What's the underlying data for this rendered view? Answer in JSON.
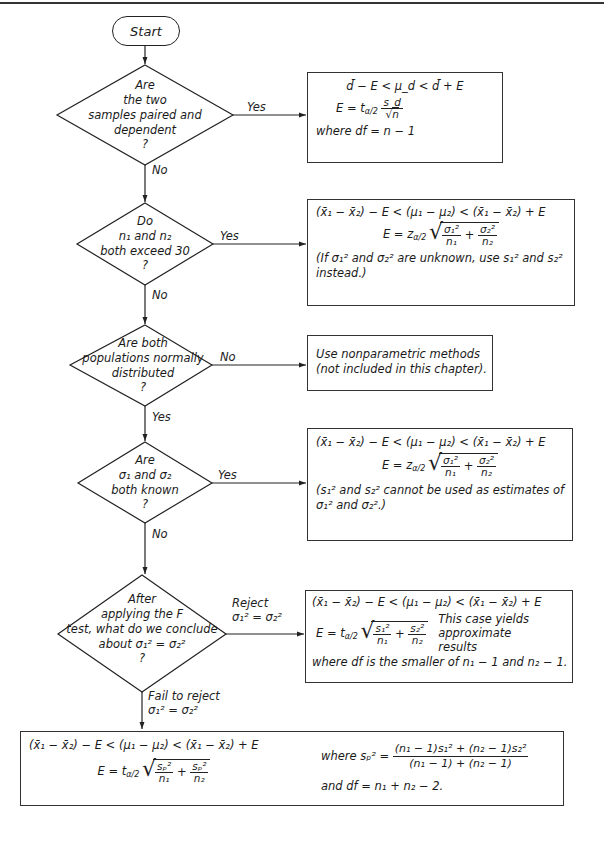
{
  "page": {
    "number": ""
  },
  "flowchart": {
    "start": {
      "label": "Start"
    },
    "decisions": [
      {
        "id": "paired",
        "lines": [
          "Are",
          "the two",
          "samples paired and",
          "dependent",
          "?"
        ],
        "yes_label": "Yes",
        "no_label": "No"
      },
      {
        "id": "large_n",
        "lines": [
          "Do",
          "n₁ and n₂",
          "both exceed 30",
          "?"
        ],
        "yes_label": "Yes",
        "no_label": "No"
      },
      {
        "id": "normal",
        "lines": [
          "Are both",
          "populations normally",
          "distributed",
          "?"
        ],
        "no_label": "No",
        "yes_label": "Yes"
      },
      {
        "id": "sigma_known",
        "lines": [
          "Are",
          "σ₁ and σ₂",
          "both known",
          "?"
        ],
        "yes_label": "Yes",
        "no_label": "No"
      },
      {
        "id": "f_test",
        "lines": [
          "After",
          "applying the F",
          "test, what do we conclude",
          "about  σ₁² = σ₂²",
          "?"
        ],
        "reject_label": [
          "Reject",
          "σ₁² = σ₂²"
        ],
        "fail_label": [
          "Fail to reject",
          "σ₁² = σ₂²"
        ]
      }
    ],
    "results": {
      "paired": {
        "interval": "d̄ − E < μ_d < d̄ + E",
        "margin_lhs": "E = t",
        "margin_sub": "α/2",
        "margin_num": "s_d",
        "margin_den": "n",
        "df": "where df = n − 1"
      },
      "large_samples": {
        "interval": "(x̄₁ − x̄₂) − E < (μ₁ − μ₂) < (x̄₁ − x̄₂) + E",
        "margin_lhs": "E = z",
        "margin_sub": "α/2",
        "term1_num": "σ₁²",
        "term1_den": "n₁",
        "term2_num": "σ₂²",
        "term2_den": "n₂",
        "note_line1": "(If σ₁² and σ₂² are unknown, use s₁² and s₂²",
        "note_line2": "instead.)"
      },
      "nonparametric": {
        "line1": "Use nonparametric methods",
        "line2": "(not included in this chapter)."
      },
      "sigma_known": {
        "interval": "(x̄₁ − x̄₂) − E < (μ₁ − μ₂) < (x̄₁ − x̄₂) + E",
        "margin_lhs": "E = z",
        "margin_sub": "α/2",
        "term1_num": "σ₁²",
        "term1_den": "n₁",
        "term2_num": "σ₂²",
        "term2_den": "n₂",
        "note_line1": "(s₁² and s₂² cannot be used as estimates of",
        "note_line2": "σ₁² and σ₂².)"
      },
      "unequal_var": {
        "interval": "(x̄₁ − x̄₂) − E < (μ₁ − μ₂) < (x̄₁ − x̄₂) + E",
        "margin_lhs": "E = t",
        "margin_sub": "α/2",
        "term1_num": "s₁²",
        "term1_den": "n₁",
        "term2_num": "s₂²",
        "term2_den": "n₂",
        "side_note": [
          "This case yields",
          "approximate",
          "results"
        ],
        "df": "where df is the smaller of n₁ − 1 and n₂ − 1."
      },
      "pooled": {
        "interval": "(x̄₁ − x̄₂) − E < (μ₁ − μ₂) < (x̄₁ − x̄₂) + E",
        "margin_lhs": "E = t",
        "margin_sub": "α/2",
        "term1_num": "sₚ²",
        "term1_den": "n₁",
        "term2_num": "sₚ²",
        "term2_den": "n₂",
        "pooled_lhs": "where sₚ² =",
        "pooled_num": "(n₁ − 1)s₁² + (n₂ − 1)s₂²",
        "pooled_den": "(n₁ − 1) + (n₂ − 1)",
        "df": "and df = n₁ + n₂ − 2."
      }
    }
  }
}
